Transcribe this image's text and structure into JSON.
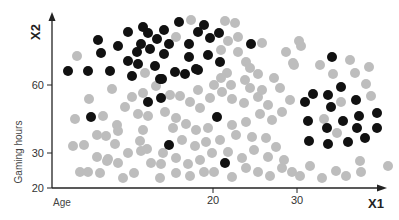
{
  "chart_data": {
    "type": "scatter",
    "title": "",
    "xlabel": "X1",
    "ylabel": "X2",
    "x_description": "Age",
    "y_description": "Gaming hours",
    "x_ticks": [
      {
        "label": "20",
        "px": 213
      },
      {
        "label": "30",
        "px": 297
      }
    ],
    "y_ticks": [
      {
        "label": "60",
        "py": 85
      },
      {
        "label": "30",
        "py": 153
      },
      {
        "label": "20",
        "py": 188
      }
    ],
    "grid": false,
    "legend": null,
    "colors": {
      "cluster_a": "#111111",
      "cluster_b": "#bdbdbd",
      "axis": "#222222"
    },
    "axes_px": {
      "origin_x": 52,
      "origin_y": 188,
      "x_end": 385,
      "y_top": 14
    },
    "series": [
      {
        "name": "cluster_a",
        "color": "#111111",
        "points_px": [
          [
            68,
            71
          ],
          [
            88,
            71
          ],
          [
            110,
            71
          ],
          [
            101,
            53
          ],
          [
            98,
            40
          ],
          [
            118,
            46
          ],
          [
            128,
            61
          ],
          [
            138,
            64
          ],
          [
            128,
            32
          ],
          [
            141,
            44
          ],
          [
            137,
            52
          ],
          [
            143,
            27
          ],
          [
            148,
            33
          ],
          [
            164,
            30
          ],
          [
            179,
            22
          ],
          [
            157,
            39
          ],
          [
            169,
            44
          ],
          [
            150,
            49
          ],
          [
            164,
            54
          ],
          [
            189,
            44
          ],
          [
            198,
            32
          ],
          [
            189,
            57
          ],
          [
            196,
            69
          ],
          [
            155,
            66
          ],
          [
            160,
            79
          ],
          [
            175,
            72
          ],
          [
            185,
            74
          ],
          [
            132,
            76
          ],
          [
            162,
            79
          ],
          [
            204,
            25
          ],
          [
            210,
            38
          ],
          [
            219,
            33
          ],
          [
            208,
            55
          ],
          [
            220,
            62
          ],
          [
            198,
            70
          ],
          [
            251,
            44
          ],
          [
            148,
            102
          ],
          [
            161,
            98
          ],
          [
            91,
            117
          ],
          [
            169,
            145
          ],
          [
            217,
            117
          ],
          [
            225,
            163
          ],
          [
            332,
            57
          ],
          [
            341,
            87
          ],
          [
            313,
            94
          ],
          [
            305,
            102
          ],
          [
            328,
            95
          ],
          [
            331,
            107
          ],
          [
            356,
            100
          ],
          [
            308,
            121
          ],
          [
            343,
            121
          ],
          [
            359,
            116
          ],
          [
            377,
            113
          ],
          [
            327,
            128
          ],
          [
            357,
            128
          ],
          [
            377,
            128
          ],
          [
            309,
            141
          ],
          [
            328,
            144
          ],
          [
            348,
            142
          ],
          [
            365,
            138
          ]
        ]
      },
      {
        "name": "cluster_b",
        "color": "#bdbdbd",
        "points_px": [
          [
            77,
            56
          ],
          [
            145,
            73
          ],
          [
            176,
            37
          ],
          [
            191,
            20
          ],
          [
            225,
            21
          ],
          [
            235,
            23
          ],
          [
            228,
            41
          ],
          [
            238,
            37
          ],
          [
            221,
            50
          ],
          [
            238,
            52
          ],
          [
            246,
            62
          ],
          [
            227,
            73
          ],
          [
            250,
            68
          ],
          [
            258,
            74
          ],
          [
            245,
            80
          ],
          [
            221,
            78
          ],
          [
            274,
            78
          ],
          [
            262,
            43
          ],
          [
            286,
            52
          ],
          [
            293,
            63
          ],
          [
            299,
            41
          ],
          [
            301,
            46
          ],
          [
            294,
            65
          ],
          [
            320,
            65
          ],
          [
            333,
            74
          ],
          [
            350,
            60
          ],
          [
            355,
            73
          ],
          [
            369,
            67
          ],
          [
            366,
            84
          ],
          [
            371,
            96
          ],
          [
            341,
            102
          ],
          [
            324,
            119
          ],
          [
            337,
            133
          ],
          [
            89,
            99
          ],
          [
            112,
            89
          ],
          [
            132,
            97
          ],
          [
            143,
            93
          ],
          [
            156,
            86
          ],
          [
            125,
            107
          ],
          [
            103,
            116
          ],
          [
            75,
            119
          ],
          [
            117,
            125
          ],
          [
            143,
            130
          ],
          [
            148,
            116
          ],
          [
            138,
            114
          ],
          [
            165,
            112
          ],
          [
            84,
            145
          ],
          [
            97,
            135
          ],
          [
            106,
            136
          ],
          [
            118,
            131
          ],
          [
            140,
            141
          ],
          [
            115,
            144
          ],
          [
            73,
            146
          ],
          [
            97,
            157
          ],
          [
            108,
            159
          ],
          [
            128,
            153
          ],
          [
            88,
            172
          ],
          [
            100,
            173
          ],
          [
            107,
            161
          ],
          [
            118,
            163
          ],
          [
            123,
            178
          ],
          [
            134,
            173
          ],
          [
            141,
            151
          ],
          [
            151,
            163
          ],
          [
            161,
            164
          ],
          [
            160,
            178
          ],
          [
            163,
            153
          ],
          [
            147,
            149
          ],
          [
            80,
            172
          ],
          [
            170,
            95
          ],
          [
            180,
            96
          ],
          [
            190,
            102
          ],
          [
            200,
            108
          ],
          [
            210,
            98
          ],
          [
            222,
            92
          ],
          [
            232,
            99
          ],
          [
            244,
            103
          ],
          [
            258,
            97
          ],
          [
            268,
            105
          ],
          [
            176,
            118
          ],
          [
            186,
            124
          ],
          [
            196,
            130
          ],
          [
            208,
            128
          ],
          [
            232,
            125
          ],
          [
            246,
            122
          ],
          [
            260,
            114
          ],
          [
            272,
            120
          ],
          [
            282,
            112
          ],
          [
            290,
            100
          ],
          [
            173,
            128
          ],
          [
            182,
            140
          ],
          [
            195,
            146
          ],
          [
            206,
            142
          ],
          [
            220,
            140
          ],
          [
            236,
            135
          ],
          [
            252,
            137
          ],
          [
            266,
            138
          ],
          [
            276,
            147
          ],
          [
            176,
            158
          ],
          [
            188,
            164
          ],
          [
            200,
            160
          ],
          [
            212,
            153
          ],
          [
            228,
            152
          ],
          [
            242,
            158
          ],
          [
            254,
            150
          ],
          [
            268,
            157
          ],
          [
            284,
            160
          ],
          [
            176,
            173
          ],
          [
            190,
            176
          ],
          [
            204,
            172
          ],
          [
            214,
            172
          ],
          [
            232,
            177
          ],
          [
            246,
            168
          ],
          [
            258,
            172
          ],
          [
            270,
            176
          ],
          [
            282,
            168
          ],
          [
            292,
            172
          ],
          [
            300,
            176
          ],
          [
            310,
            166
          ],
          [
            322,
            178
          ],
          [
            336,
            171
          ],
          [
            346,
            176
          ],
          [
            361,
            172
          ],
          [
            360,
            161
          ],
          [
            388,
            166
          ],
          [
            198,
            90
          ],
          [
            214,
            85
          ],
          [
            231,
            85
          ],
          [
            250,
            88
          ],
          [
            262,
            90
          ],
          [
            280,
            88
          ]
        ]
      }
    ]
  }
}
